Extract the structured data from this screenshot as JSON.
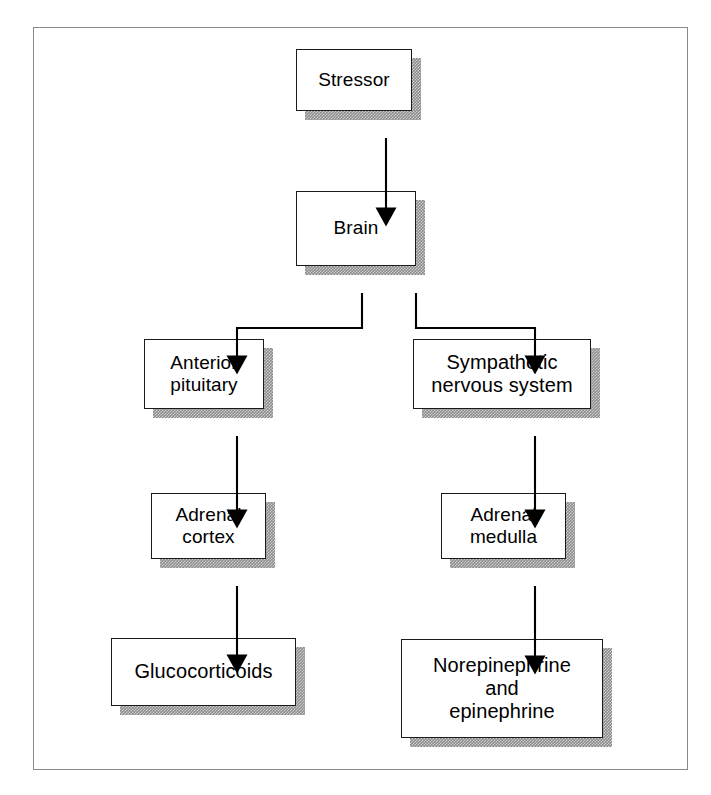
{
  "figure": {
    "type": "flowchart",
    "frame_border_color": "#8a8a8a",
    "box_border_color": "#1a1a1a",
    "box_fill_color": "#ffffff",
    "shadow_color": "#8c8c8c",
    "arrow_color": "#000000"
  },
  "nodes": [
    {
      "id": "stressor",
      "label": "Stressor"
    },
    {
      "id": "brain",
      "label": "Brain"
    },
    {
      "id": "anterior_pituitary",
      "label": "Anterior\npituitary"
    },
    {
      "id": "sympathetic",
      "label": "Sympathetic\nnervous system"
    },
    {
      "id": "adrenal_cortex",
      "label": "Adrenal\ncortex"
    },
    {
      "id": "adrenal_medulla",
      "label": "Adrenal\nmedulla"
    },
    {
      "id": "glucocorticoids",
      "label": "Glucocorticoids"
    },
    {
      "id": "catecholamines",
      "label": "Norepinephrine\nand\nepinephrine"
    }
  ],
  "edges": [
    {
      "from": "stressor",
      "to": "brain"
    },
    {
      "from": "brain",
      "to": "anterior_pituitary"
    },
    {
      "from": "brain",
      "to": "sympathetic"
    },
    {
      "from": "anterior_pituitary",
      "to": "adrenal_cortex"
    },
    {
      "from": "sympathetic",
      "to": "adrenal_medulla"
    },
    {
      "from": "adrenal_cortex",
      "to": "glucocorticoids"
    },
    {
      "from": "adrenal_medulla",
      "to": "catecholamines"
    }
  ]
}
